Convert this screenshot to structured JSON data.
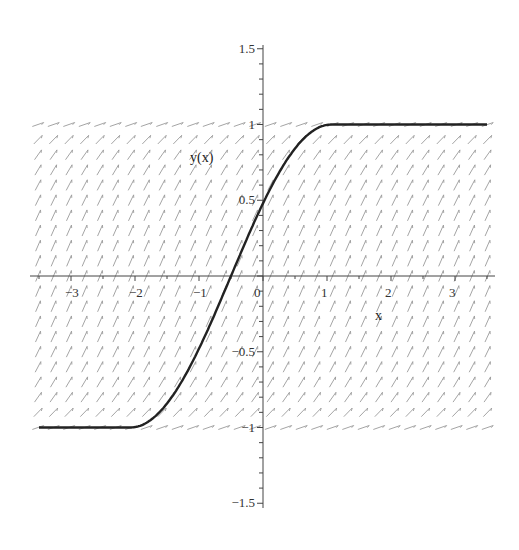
{
  "chart_data": {
    "type": "line",
    "title": "",
    "xlabel": "x",
    "ylabel": "y(x)",
    "xlim": [
      -3.5,
      3.5
    ],
    "ylim": [
      -1.5,
      1.5
    ],
    "grid": false,
    "legend": null,
    "x_ticks": [
      -3,
      -2,
      -1,
      0,
      1,
      2,
      3
    ],
    "x_tick_labels": [
      "−3",
      "−2",
      "−1",
      "0",
      "1",
      "2",
      "3"
    ],
    "y_ticks": [
      1.5,
      1,
      0.5,
      -0.5,
      -1,
      -1.5
    ],
    "y_tick_labels": [
      "1.5",
      "1",
      "0.5",
      "−0.5",
      "−1",
      "−1.5"
    ],
    "direction_field": {
      "y_range": [
        -1,
        1
      ],
      "x_range": [
        -3.5,
        3.5
      ],
      "slope_function": "sqrt(1 - y^2)",
      "color": "#9a9a9a"
    },
    "series": [
      {
        "name": "y(x)",
        "color": "#222222",
        "x": [
          -3.5,
          -2.07,
          -1.75,
          -1.5,
          -1.25,
          -1.0,
          -0.75,
          -0.5,
          -0.25,
          0.0,
          0.25,
          0.5,
          0.75,
          1.07,
          3.5
        ],
        "y": [
          -1.0,
          -1.0,
          -0.95,
          -0.84,
          -0.68,
          -0.48,
          -0.25,
          0.0,
          0.25,
          0.48,
          0.68,
          0.84,
          0.95,
          1.0,
          1.0
        ]
      }
    ]
  },
  "labels": {
    "x_axis_title": "x",
    "y_axis_title": "y(x)"
  }
}
